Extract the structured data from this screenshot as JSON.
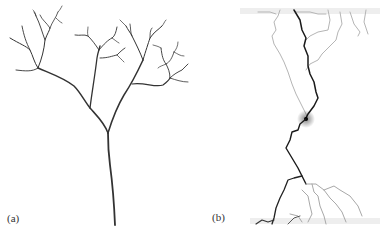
{
  "figure": {
    "panels": [
      {
        "id": "a",
        "label": "(a)",
        "content": "branching tree structure",
        "stroke_color": "#333333"
      },
      {
        "id": "b",
        "label": "(b)",
        "content": "discharge path with faint side branches",
        "main_path_color": "#1a1a1a",
        "side_path_color": "#9a9a9a"
      }
    ]
  }
}
